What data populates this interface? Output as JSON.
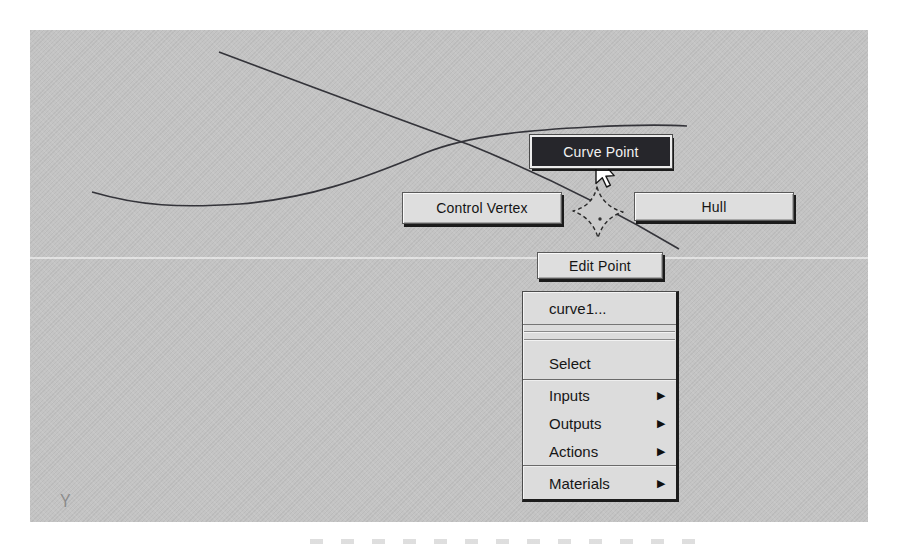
{
  "colors": {
    "page_bg": "#ffffff",
    "canvas_bg": "#c4c4c4",
    "button_face": "#dedede",
    "button_text": "#141414",
    "selected_button_bg": "#26262b",
    "selected_button_text": "#f2f2f2",
    "menu_face": "#dcdcdc",
    "curve_stroke": "#34343a",
    "shadow": "#141414"
  },
  "marking_menu": {
    "north": {
      "label": "Curve Point",
      "selected": true
    },
    "west": {
      "label": "Control Vertex",
      "selected": false
    },
    "east": {
      "label": "Hull",
      "selected": false
    },
    "south": {
      "label": "Edit Point",
      "selected": false
    }
  },
  "context_menu": {
    "title": "curve1...",
    "items": [
      {
        "label": "Select",
        "has_submenu": false
      },
      {
        "label": "Inputs",
        "has_submenu": true
      },
      {
        "label": "Outputs",
        "has_submenu": true
      },
      {
        "label": "Actions",
        "has_submenu": true
      },
      {
        "label": "Materials",
        "has_submenu": true
      }
    ]
  },
  "icons": {
    "submenu_arrow": "▶"
  },
  "axis_marker": {
    "label": "Y"
  }
}
